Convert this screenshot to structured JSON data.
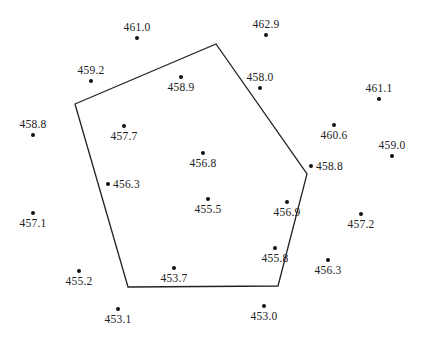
{
  "diagram": {
    "type": "spot-elevation map with enclosing polygon",
    "polygon": {
      "stroke": "#222222",
      "vertices": [
        [
          75,
          104
        ],
        [
          216,
          44
        ],
        [
          307,
          174
        ],
        [
          278,
          286
        ],
        [
          128,
          287
        ]
      ]
    },
    "points": [
      {
        "id": "p1",
        "value": "461.0",
        "x": 137,
        "y": 38,
        "label_pos": "above"
      },
      {
        "id": "p2",
        "value": "462.9",
        "x": 266,
        "y": 35,
        "label_pos": "above"
      },
      {
        "id": "p3",
        "value": "459.2",
        "x": 91,
        "y": 81,
        "label_pos": "above"
      },
      {
        "id": "p4",
        "value": "458.9",
        "x": 181,
        "y": 77,
        "label_pos": "below"
      },
      {
        "id": "p5",
        "value": "458.0",
        "x": 260,
        "y": 88,
        "label_pos": "above"
      },
      {
        "id": "p6",
        "value": "461.1",
        "x": 379,
        "y": 99,
        "label_pos": "above"
      },
      {
        "id": "p7",
        "value": "458.8",
        "x": 33,
        "y": 135,
        "label_pos": "above"
      },
      {
        "id": "p8",
        "value": "457.7",
        "x": 124,
        "y": 126,
        "label_pos": "below"
      },
      {
        "id": "p9",
        "value": "460.6",
        "x": 334,
        "y": 125,
        "label_pos": "below"
      },
      {
        "id": "p10",
        "value": "459.0",
        "x": 392,
        "y": 156,
        "label_pos": "above"
      },
      {
        "id": "p11",
        "value": "456.8",
        "x": 203,
        "y": 153,
        "label_pos": "below"
      },
      {
        "id": "p12",
        "value": "458.8",
        "x": 311,
        "y": 166,
        "label_pos": "right"
      },
      {
        "id": "p13",
        "value": "456.3",
        "x": 108,
        "y": 184,
        "label_pos": "right"
      },
      {
        "id": "p14",
        "value": "457.1",
        "x": 33,
        "y": 213,
        "label_pos": "below"
      },
      {
        "id": "p15",
        "value": "455.5",
        "x": 208,
        "y": 199,
        "label_pos": "below"
      },
      {
        "id": "p16",
        "value": "456.9",
        "x": 287,
        "y": 202,
        "label_pos": "below"
      },
      {
        "id": "p17",
        "value": "457.2",
        "x": 361,
        "y": 214,
        "label_pos": "below"
      },
      {
        "id": "p18",
        "value": "455.8",
        "x": 275,
        "y": 248,
        "label_pos": "below"
      },
      {
        "id": "p19",
        "value": "456.3",
        "x": 328,
        "y": 260,
        "label_pos": "below"
      },
      {
        "id": "p20",
        "value": "455.2",
        "x": 79,
        "y": 271,
        "label_pos": "below"
      },
      {
        "id": "p21",
        "value": "453.7",
        "x": 174,
        "y": 268,
        "label_pos": "below"
      },
      {
        "id": "p22",
        "value": "453.1",
        "x": 118,
        "y": 309,
        "label_pos": "below"
      },
      {
        "id": "p23",
        "value": "453.0",
        "x": 264,
        "y": 306,
        "label_pos": "below"
      }
    ]
  }
}
